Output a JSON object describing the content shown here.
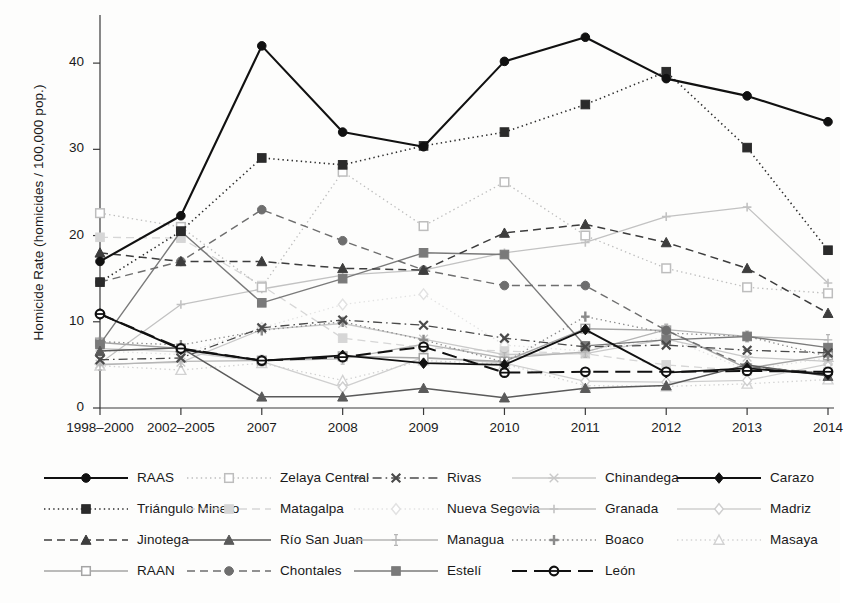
{
  "chart_data": {
    "type": "line",
    "title": "",
    "xlabel": "",
    "ylabel": "Homicide Rate (homicides / 100,000 pop.)",
    "categories": [
      "1998–2000",
      "2002–2005",
      "2007",
      "2008",
      "2009",
      "2010",
      "2011",
      "2012",
      "2013",
      "2014"
    ],
    "ylim": [
      0,
      45
    ],
    "yticks": [
      0,
      10,
      20,
      30,
      40
    ],
    "grid": false,
    "legend_position": "bottom",
    "legend_columns": 5,
    "series": [
      {
        "name": "RAAS",
        "color": "#111111",
        "dash": "none",
        "marker": "circle-filled",
        "width": 2.1,
        "values": [
          17.0,
          22.3,
          42.0,
          32.0,
          30.3,
          40.2,
          43.0,
          38.2,
          36.2,
          33.2
        ]
      },
      {
        "name": "Zelaya Central",
        "color": "#bdbdbd",
        "dash": "dotted",
        "marker": "square-open",
        "width": 1.3,
        "values": [
          22.6,
          21.0,
          14.0,
          27.4,
          21.1,
          26.2,
          20.0,
          16.2,
          14.0,
          13.3
        ]
      },
      {
        "name": "Rivas",
        "color": "#4a4a4a",
        "dash": "dashdot",
        "marker": "x",
        "width": 1.3,
        "values": [
          5.6,
          5.8,
          9.3,
          10.2,
          9.6,
          8.1,
          7.1,
          7.3,
          6.7,
          6.4
        ]
      },
      {
        "name": "Chinandega",
        "color": "#c9c9c9",
        "dash": "none",
        "marker": "x-thin",
        "width": 1.3,
        "values": [
          5.1,
          5.3,
          9.1,
          9.8,
          8.0,
          6.2,
          6.3,
          8.0,
          5.9,
          5.4
        ]
      },
      {
        "name": "Carazo",
        "color": "#111111",
        "dash": "none",
        "marker": "diamond-filled",
        "width": 1.9,
        "values": [
          10.9,
          6.8,
          5.5,
          6.1,
          5.2,
          5.0,
          9.1,
          4.1,
          4.6,
          3.9
        ]
      },
      {
        "name": "Triángulo Minero",
        "color": "#2b2b2b",
        "dash": "dotted",
        "marker": "square-filled",
        "width": 1.6,
        "values": [
          14.6,
          20.5,
          29.0,
          28.2,
          30.4,
          32.0,
          35.2,
          39.0,
          30.2,
          18.3
        ]
      },
      {
        "name": "Matagalpa",
        "color": "#d6d6d6",
        "dash": "dashed",
        "marker": "square-filled",
        "width": 1.3,
        "values": [
          19.8,
          19.7,
          14.2,
          8.1,
          7.0,
          6.6,
          6.3,
          5.0,
          4.3,
          4.2
        ]
      },
      {
        "name": "Nueva Segovia",
        "color": "#e2e2e2",
        "dash": "dotted",
        "marker": "diamond-open",
        "width": 1.3,
        "values": [
          6.6,
          6.2,
          9.3,
          12.0,
          13.2,
          7.3,
          6.6,
          8.2,
          4.4,
          5.8
        ]
      },
      {
        "name": "Granada",
        "color": "#c2c2c2",
        "dash": "none",
        "marker": "plus",
        "width": 1.3,
        "values": [
          5.2,
          12.0,
          13.8,
          15.4,
          16.0,
          18.0,
          19.2,
          22.2,
          23.3,
          14.5
        ]
      },
      {
        "name": "Madriz",
        "color": "#cfcfcf",
        "dash": "none",
        "marker": "diamond-open",
        "width": 1.3,
        "values": [
          6.9,
          6.5,
          5.4,
          2.4,
          5.9,
          5.2,
          3.1,
          3.0,
          3.2,
          5.1
        ]
      },
      {
        "name": "Jinotega",
        "color": "#3d3d3d",
        "dash": "dashed",
        "marker": "triangle-filled",
        "width": 1.5,
        "values": [
          18.0,
          17.0,
          17.0,
          16.2,
          16.0,
          20.3,
          21.3,
          19.2,
          16.2,
          11.0
        ]
      },
      {
        "name": "Río San Juan",
        "color": "#5a5a5a",
        "dash": "none",
        "marker": "triangle-filled",
        "width": 1.5,
        "values": [
          6.6,
          7.0,
          1.3,
          1.3,
          2.3,
          1.2,
          2.3,
          2.6,
          5.0,
          3.7
        ]
      },
      {
        "name": "Managua",
        "color": "#b5b5b5",
        "dash": "none",
        "marker": "plus-serif",
        "width": 1.3,
        "values": [
          5.0,
          5.4,
          5.5,
          5.7,
          7.4,
          5.8,
          6.5,
          9.1,
          8.3,
          7.9
        ]
      },
      {
        "name": "Boaco",
        "color": "#8a8a8a",
        "dash": "dotted",
        "marker": "plus-bold",
        "width": 1.3,
        "values": [
          7.7,
          7.3,
          9.0,
          10.0,
          7.9,
          5.3,
          10.6,
          8.7,
          8.3,
          6.0
        ]
      },
      {
        "name": "Masaya",
        "color": "#d2d2d2",
        "dash": "dotted",
        "marker": "triangle-open",
        "width": 1.3,
        "values": [
          4.9,
          4.4,
          5.2,
          3.2,
          5.5,
          5.1,
          2.6,
          2.5,
          2.8,
          3.3
        ]
      },
      {
        "name": "RAAN",
        "color": "#a5a5a5",
        "dash": "none",
        "marker": "square-open",
        "width": 1.4,
        "values": [
          7.6,
          6.9,
          5.5,
          6.0,
          5.8,
          5.4,
          9.2,
          9.0,
          4.6,
          6.1
        ]
      },
      {
        "name": "Chontales",
        "color": "#6e6e6e",
        "dash": "dashed",
        "marker": "circle-filled",
        "width": 1.4,
        "values": [
          14.6,
          17.0,
          23.0,
          19.4,
          16.0,
          14.2,
          14.2,
          9.0,
          4.8,
          4.0
        ]
      },
      {
        "name": "Estelí",
        "color": "#7a7a7a",
        "dash": "none",
        "marker": "square-filled",
        "width": 1.4,
        "values": [
          7.4,
          20.5,
          12.2,
          15.0,
          18.0,
          17.8,
          7.2,
          7.9,
          8.3,
          7.0
        ]
      },
      {
        "name": "León",
        "color": "#111111",
        "dash": "longdash",
        "marker": "circle-open",
        "width": 2.0,
        "values": [
          10.9,
          6.9,
          5.5,
          5.9,
          7.1,
          4.1,
          4.2,
          4.2,
          4.3,
          4.2
        ]
      }
    ]
  },
  "legend": {
    "rows": [
      [
        "RAAS",
        "Zelaya Central",
        "Rivas",
        "Chinandega",
        "Carazo"
      ],
      [
        "Triángulo Minero",
        "Matagalpa",
        "Nueva Segovia",
        "Granada",
        "Madriz"
      ],
      [
        "Jinotega",
        "Río San Juan",
        "Managua",
        "Boaco",
        "Masaya"
      ],
      [
        "RAAN",
        "Chontales",
        "Estelí",
        "León"
      ]
    ]
  },
  "axis": {
    "y_title": "Homicide Rate (homicides / 100,000 pop.)",
    "y_ticks": [
      "0",
      "10",
      "20",
      "30",
      "40"
    ],
    "x_ticks": [
      "1998–2000",
      "2002–2005",
      "2007",
      "2008",
      "2009",
      "2010",
      "2011",
      "2012",
      "2013",
      "2014"
    ]
  }
}
